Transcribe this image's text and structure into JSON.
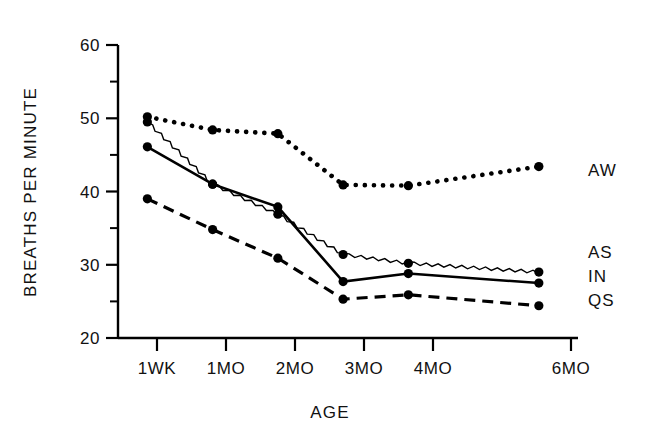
{
  "chart_data": {
    "type": "line",
    "title": "",
    "xlabel": "AGE",
    "ylabel": "BREATHS PER MINUTE",
    "categories": [
      "1WK",
      "1MO",
      "2MO",
      "3MO",
      "4MO",
      "6MO"
    ],
    "x_positions": [
      0,
      1,
      2,
      3,
      4,
      6
    ],
    "xlim": [
      -0.45,
      6.6
    ],
    "ylim": [
      20,
      60
    ],
    "y_ticks_major": [
      20,
      30,
      40,
      50,
      60
    ],
    "y_ticks_minor": [
      25,
      35,
      45,
      55
    ],
    "grid": false,
    "legend_position": "right-inline",
    "series": [
      {
        "name": "AW",
        "label": "AW",
        "linestyle": "dotted",
        "color": "#000000",
        "values": [
          50.2,
          48.4,
          47.9,
          40.9,
          40.8,
          43.4
        ]
      },
      {
        "name": "AS",
        "label": "AS",
        "linestyle": "wavy-thin",
        "color": "#000000",
        "values": [
          49.5,
          41.0,
          36.9,
          31.4,
          30.2,
          29.0
        ]
      },
      {
        "name": "IN",
        "label": "IN",
        "linestyle": "solid",
        "color": "#000000",
        "values": [
          46.1,
          41.0,
          37.9,
          27.7,
          28.8,
          27.5
        ]
      },
      {
        "name": "QS",
        "label": "QS",
        "linestyle": "dashed",
        "color": "#000000",
        "values": [
          39.0,
          34.8,
          30.9,
          25.3,
          25.9,
          24.4
        ]
      }
    ]
  },
  "axes": {
    "y_tick_labels": [
      "60",
      "50",
      "40",
      "30",
      "20"
    ],
    "x_tick_labels": [
      "1WK",
      "1MO",
      "2MO",
      "3MO",
      "4MO",
      "6MO"
    ],
    "x_title": "AGE",
    "y_title": "BREATHS PER MINUTE"
  },
  "legend": {
    "entries": [
      "AW",
      "AS",
      "IN",
      "QS"
    ]
  }
}
